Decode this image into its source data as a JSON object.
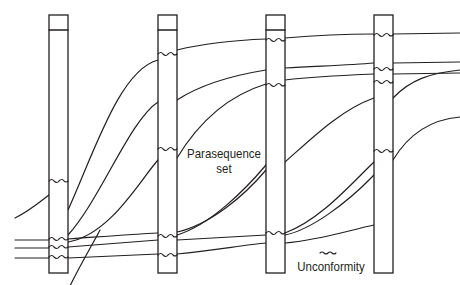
{
  "diagram": {
    "type": "stratigraphic-correlation",
    "colors": {
      "stroke": "#231f20",
      "background": "#ffffff"
    },
    "labels": {
      "parasequence_set_line1": "Parasequence",
      "parasequence_set_line2": "set",
      "unconformity": "Unconformity"
    },
    "legend": {
      "symbol": "wavy-line",
      "meaning": "Unconformity"
    },
    "columns": [
      {
        "id": "well-1",
        "x": 49,
        "width": 19,
        "top": 15,
        "cap": 30,
        "bottom": 273
      },
      {
        "id": "well-2",
        "x": 158,
        "width": 19,
        "top": 15,
        "cap": 30,
        "bottom": 273
      },
      {
        "id": "well-3",
        "x": 266,
        "width": 19,
        "top": 15,
        "cap": 30,
        "bottom": 273
      },
      {
        "id": "well-4",
        "x": 374,
        "width": 19,
        "top": 15,
        "cap": null,
        "bottom": 273
      }
    ]
  }
}
